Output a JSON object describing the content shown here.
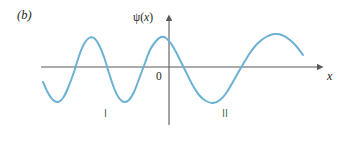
{
  "figure": {
    "panel_label": "(b)",
    "background_color": "#ffffff"
  },
  "axes": {
    "y_axis_label": "ψ(",
    "y_axis_label_var": "x",
    "y_axis_label_close": ")",
    "x_axis_label": "x",
    "origin_label": "0",
    "axis_color": "#58595b",
    "x_axis_start_px": 41,
    "x_axis_end_px": 322,
    "x_axis_y_px": 67,
    "y_axis_x_px": 169,
    "y_axis_top_px": 17,
    "y_axis_bottom_px": 125
  },
  "annotations": {
    "region_one": "I",
    "region_two": "II",
    "region_label_color": "#4b6b4f"
  },
  "chart_data": {
    "type": "line",
    "title": "",
    "subtitle": "",
    "xlabel": "x",
    "ylabel": "ψ(x)",
    "grid": false,
    "legend": null,
    "series": [
      {
        "name": "wavefunction",
        "color": "#6cb0d4",
        "line_width": 2.0,
        "description": "Oscillating wavefunction: shorter wavelength and smaller amplitude in region I (left of origin), longer wavelength and larger amplitude in region II (right of origin).",
        "points": [
          [
            43,
            82
          ],
          [
            48,
            93
          ],
          [
            53,
            100
          ],
          [
            58,
            102
          ],
          [
            63,
            98
          ],
          [
            68,
            88
          ],
          [
            74,
            72
          ],
          [
            79,
            56
          ],
          [
            84,
            44
          ],
          [
            89,
            38
          ],
          [
            94,
            38
          ],
          [
            99,
            45
          ],
          [
            104,
            57
          ],
          [
            109,
            73
          ],
          [
            114,
            88
          ],
          [
            119,
            98
          ],
          [
            124,
            102
          ],
          [
            129,
            100
          ],
          [
            134,
            92
          ],
          [
            139,
            79
          ],
          [
            145,
            63
          ],
          [
            150,
            50
          ],
          [
            156,
            41
          ],
          [
            161,
            37
          ],
          [
            166,
            38
          ],
          [
            172,
            45
          ],
          [
            178,
            56
          ],
          [
            185,
            70
          ],
          [
            192,
            84
          ],
          [
            199,
            95
          ],
          [
            206,
            101
          ],
          [
            213,
            103
          ],
          [
            220,
            100
          ],
          [
            227,
            92
          ],
          [
            234,
            80
          ],
          [
            242,
            66
          ],
          [
            250,
            53
          ],
          [
            258,
            43
          ],
          [
            266,
            37
          ],
          [
            274,
            34
          ],
          [
            282,
            35
          ],
          [
            290,
            40
          ],
          [
            297,
            47
          ],
          [
            303,
            55
          ]
        ],
        "regions": [
          {
            "label": "I",
            "x_start_px": 43,
            "x_end_px": 169,
            "wavelength_px": 50,
            "amplitude_px": 30
          },
          {
            "label": "II",
            "x_start_px": 169,
            "x_end_px": 303,
            "wavelength_px": 104,
            "amplitude_px": 33
          }
        ]
      }
    ],
    "xlim": [
      41,
      322
    ],
    "ylim": [
      125,
      17
    ]
  }
}
